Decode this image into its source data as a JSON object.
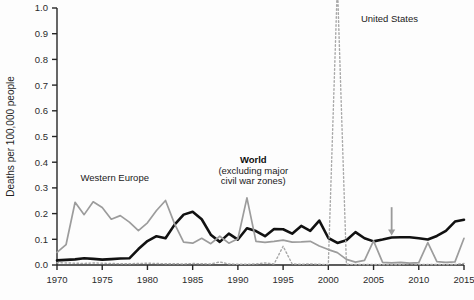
{
  "chart_data": {
    "type": "line",
    "title": "",
    "subtitle": "",
    "xlabel": "",
    "ylabel": "Deaths per 100,000 people",
    "xlim": [
      1970,
      2015
    ],
    "ylim": [
      0.0,
      1.0
    ],
    "grid": false,
    "legend_position": "inline-annotations",
    "x_ticks": [
      "1970",
      "1975",
      "1980",
      "1985",
      "1990",
      "1995",
      "2000",
      "2005",
      "2010",
      "2015"
    ],
    "x_tick_values": [
      1970,
      1975,
      1980,
      1985,
      1990,
      1995,
      2000,
      2005,
      2010,
      2015
    ],
    "y_ticks": [
      "0.0",
      "0.1",
      "0.2",
      "0.3",
      "0.4",
      "0.5",
      "0.6",
      "0.7",
      "0.8",
      "0.9",
      "1.0"
    ],
    "y_tick_values": [
      0.0,
      0.1,
      0.2,
      0.3,
      0.4,
      0.5,
      0.6,
      0.7,
      0.8,
      0.9,
      1.0
    ],
    "annotations": [
      {
        "name": "western-europe-label",
        "text": "Western Europe",
        "x": 1972.6,
        "y": 0.325,
        "bold": false
      },
      {
        "name": "world-label",
        "text": "World",
        "x": 1991.7,
        "y": 0.395,
        "bold": true
      },
      {
        "name": "world-sublabel-1",
        "text": "(excluding major",
        "x": 1991.7,
        "y": 0.355,
        "bold": false
      },
      {
        "name": "world-sublabel-2",
        "text": "civil war zones)",
        "x": 1991.7,
        "y": 0.315,
        "bold": false
      },
      {
        "name": "united-states-label",
        "text": "United States",
        "x": 2003.6,
        "y": 0.945,
        "bold": false
      }
    ],
    "arrow": {
      "name": "world-pointer-arrow",
      "x": 2007.0,
      "y_top": 0.225,
      "y_bottom": 0.115,
      "color": "#9a9a9a"
    },
    "series": [
      {
        "name": "World (excluding major civil war zones)",
        "color": "#111111",
        "style": "solid",
        "width": 2.6,
        "x": [
          1970,
          1971,
          1972,
          1973,
          1974,
          1975,
          1976,
          1977,
          1978,
          1979,
          1980,
          1981,
          1982,
          1983,
          1984,
          1985,
          1986,
          1987,
          1988,
          1989,
          1990,
          1991,
          1992,
          1993,
          1994,
          1995,
          1996,
          1997,
          1998,
          1999,
          2000,
          2001,
          2002,
          2003,
          2004,
          2005,
          2006,
          2007,
          2008,
          2009,
          2010,
          2011,
          2012,
          2013,
          2014,
          2015
        ],
        "values": [
          0.018,
          0.02,
          0.022,
          0.026,
          0.024,
          0.021,
          0.023,
          0.025,
          0.026,
          0.062,
          0.093,
          0.112,
          0.104,
          0.157,
          0.196,
          0.207,
          0.178,
          0.118,
          0.09,
          0.122,
          0.099,
          0.143,
          0.132,
          0.112,
          0.14,
          0.139,
          0.122,
          0.152,
          0.133,
          0.173,
          0.105,
          0.086,
          0.096,
          0.128,
          0.104,
          0.092,
          0.099,
          0.107,
          0.108,
          0.108,
          0.104,
          0.099,
          0.113,
          0.133,
          0.169,
          0.176
        ]
      },
      {
        "name": "Western Europe",
        "color": "#9c9c9c",
        "style": "solid",
        "width": 1.7,
        "x": [
          1970,
          1971,
          1972,
          1973,
          1974,
          1975,
          1976,
          1977,
          1978,
          1979,
          1980,
          1981,
          1982,
          1983,
          1984,
          1985,
          1986,
          1987,
          1988,
          1989,
          1990,
          1991,
          1992,
          1993,
          1994,
          1995,
          1996,
          1997,
          1998,
          1999,
          2000,
          2001,
          2002,
          2003,
          2004,
          2005,
          2006,
          2007,
          2008,
          2009,
          2010,
          2011,
          2012,
          2013,
          2014,
          2015
        ],
        "values": [
          0.049,
          0.079,
          0.244,
          0.196,
          0.246,
          0.224,
          0.178,
          0.192,
          0.167,
          0.134,
          0.164,
          0.212,
          0.251,
          0.16,
          0.089,
          0.085,
          0.104,
          0.083,
          0.112,
          0.085,
          0.102,
          0.261,
          0.092,
          0.088,
          0.092,
          0.097,
          0.089,
          0.09,
          0.092,
          0.074,
          0.06,
          0.048,
          0.022,
          0.011,
          0.018,
          0.094,
          0.01,
          0.008,
          0.01,
          0.007,
          0.009,
          0.087,
          0.013,
          0.01,
          0.012,
          0.104
        ]
      },
      {
        "name": "United States",
        "color": "#a8a8a8",
        "style": "dotted",
        "width": 1.4,
        "x": [
          1970,
          1971,
          1972,
          1973,
          1974,
          1975,
          1976,
          1977,
          1978,
          1979,
          1980,
          1981,
          1982,
          1983,
          1984,
          1985,
          1986,
          1987,
          1988,
          1989,
          1990,
          1991,
          1992,
          1993,
          1994,
          1995,
          1996,
          1997,
          1998,
          1999,
          2000,
          2001,
          2002,
          2003,
          2004,
          2005,
          2006,
          2007,
          2008,
          2009,
          2010,
          2011,
          2012,
          2013,
          2014,
          2015
        ],
        "values": [
          0.009,
          0.008,
          0.007,
          0.006,
          0.008,
          0.007,
          0.006,
          0.005,
          0.005,
          0.006,
          0.007,
          0.006,
          0.005,
          0.005,
          0.004,
          0.006,
          0.005,
          0.004,
          0.012,
          0.004,
          0.003,
          0.003,
          0.004,
          0.008,
          0.004,
          0.073,
          0.004,
          0.003,
          0.004,
          0.003,
          0.002,
          1.095,
          0.003,
          0.002,
          0.002,
          0.002,
          0.002,
          0.002,
          0.002,
          0.005,
          0.002,
          0.002,
          0.002,
          0.002,
          0.002,
          0.006
        ]
      }
    ]
  }
}
